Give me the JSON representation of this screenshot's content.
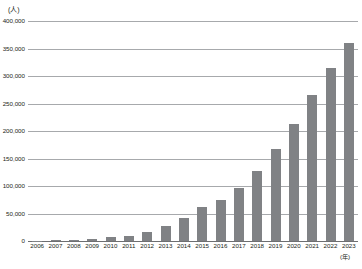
{
  "chart_data": {
    "type": "bar",
    "title": "",
    "subtitle": "",
    "xlabel": "(年)",
    "ylabel": "(人)",
    "categories": [
      "2006",
      "2007",
      "2008",
      "2009",
      "2010",
      "2011",
      "2012",
      "2013",
      "2014",
      "2015",
      "2016",
      "2017",
      "2018",
      "2019",
      "2020",
      "2021",
      "2022",
      "2023"
    ],
    "values": [
      200,
      1000,
      2000,
      4000,
      7000,
      10000,
      16000,
      28000,
      42000,
      61000,
      75000,
      96000,
      127000,
      168000,
      213000,
      265000,
      315000,
      360000
    ],
    "series": [
      {
        "name": "人数",
        "values": [
          200,
          1000,
          2000,
          4000,
          7000,
          10000,
          16000,
          28000,
          42000,
          61000,
          75000,
          96000,
          127000,
          168000,
          213000,
          265000,
          315000,
          360000
        ]
      }
    ],
    "ylim": [
      0,
      400000
    ],
    "ytick_values": [
      0,
      50000,
      100000,
      150000,
      200000,
      250000,
      300000,
      350000,
      400000
    ],
    "ytick_labels": [
      "0",
      "50,000",
      "100,000",
      "150,000",
      "200,000",
      "250,000",
      "300,000",
      "350,000",
      "400,000"
    ],
    "grid": true,
    "legend": false,
    "legend_position": "none",
    "bar_color": "#808285",
    "gridline_color": "#a7a9ac",
    "axis_color": "#6d6e71",
    "text_color": "#231f20"
  }
}
